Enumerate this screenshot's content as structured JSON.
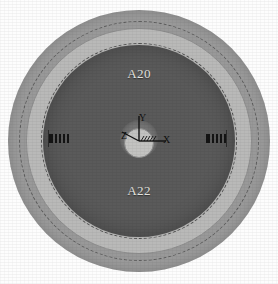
{
  "figure": {
    "type": "fea-section-view",
    "background_color": "#fdfdfd"
  },
  "geometry": {
    "center": {
      "x": 139,
      "y": 141
    },
    "rings": [
      {
        "name": "outer-annulus",
        "label": "",
        "outer_radius": 131,
        "inner_radius": 120,
        "color": "#9c9c9c"
      },
      {
        "name": "outer-boundary-arc",
        "label": "",
        "outer_radius": 120,
        "inner_radius": 113,
        "color": "#999999"
      },
      {
        "name": "mid-annulus",
        "label": "",
        "outer_radius": 113,
        "inner_radius": 98,
        "color": "#b9b9b8"
      },
      {
        "name": "core-disc",
        "label": "A20 / A22",
        "outer_radius": 96,
        "inner_radius": 0,
        "color": "#5a5a5a"
      },
      {
        "name": "center-hub",
        "label": "",
        "outer_radius": 19,
        "inner_radius": 0,
        "color": "#757575"
      }
    ]
  },
  "region_labels": {
    "upper": "A20",
    "lower": "A22",
    "color": "#e4e4e0"
  },
  "coordinate_triad": {
    "name": "origin-triad",
    "x_axis": "X",
    "y_axis": "Y",
    "z_axis": "Z",
    "color": "#111111"
  },
  "edge_marks": {
    "left": "ANS",
    "right": "ANS",
    "color": "#141414"
  },
  "colors": {
    "outer_ring": "#9c9c9c",
    "mid_ring": "#b9b9b8",
    "core": "#5a5a5a",
    "hub": "#757575",
    "hub_inner": "#c3c3c1",
    "label_text": "#e4e4e0",
    "axis_text": "#111111"
  }
}
